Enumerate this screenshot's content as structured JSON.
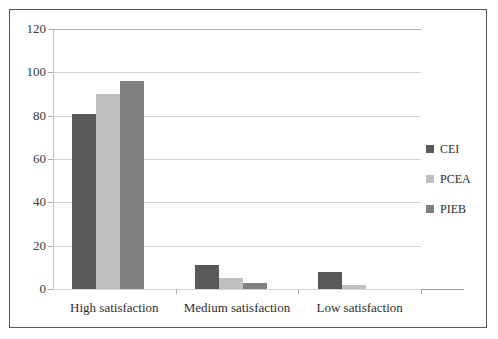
{
  "chart_data": {
    "type": "bar",
    "title": "",
    "subtitle": "",
    "xlabel": "",
    "ylabel": "",
    "categories": [
      "High satisfaction",
      "Medium satisfaction",
      "Low satisfaction"
    ],
    "series": [
      {
        "name": "CEI",
        "values": [
          81,
          11,
          8
        ],
        "color": "#595959"
      },
      {
        "name": "PCEA",
        "values": [
          90,
          5,
          2
        ],
        "color": "#bfbfbf"
      },
      {
        "name": "PIEB",
        "values": [
          96,
          3,
          0
        ],
        "color": "#808080"
      }
    ],
    "ylim": [
      0,
      120
    ],
    "yticks": [
      0,
      20,
      40,
      60,
      80,
      100,
      120
    ],
    "ytick_labels": [
      "0",
      "20",
      "40",
      "60",
      "80",
      "100",
      "120"
    ],
    "grid": true,
    "grid_axis": "y",
    "legend_position": "right",
    "border_color": "#5a5a5a",
    "gridline_color": "#d3d3d3",
    "axis_color": "#9a9a9a",
    "background": "#ffffff"
  }
}
